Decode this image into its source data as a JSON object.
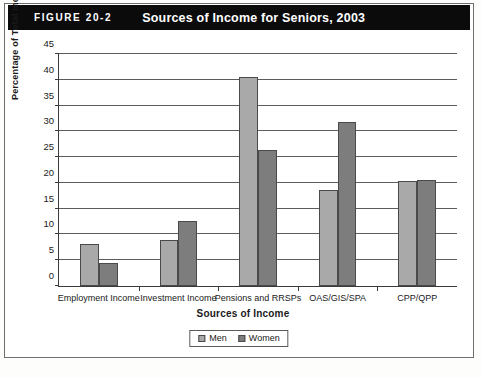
{
  "header": {
    "figure_number": "FIGURE 20-2",
    "title": "Sources of Income for Seniors, 2003"
  },
  "legend": {
    "position": "bottom-center",
    "entries": [
      {
        "label": "Men",
        "color": "#a9a9a9"
      },
      {
        "label": "Women",
        "color": "#7d7d7d"
      }
    ]
  },
  "colors": {
    "men": "#a9a9a9",
    "women": "#7d7d7d",
    "band": "#0b0b0b",
    "axis": "#3a3a3a",
    "gridline": "#5c5c5c"
  },
  "chart_data": {
    "type": "bar",
    "title": "Sources of Income for Seniors, 2003",
    "xlabel": "Sources of Income",
    "ylabel": "Percentage of Total Income",
    "categories": [
      "Employment Income",
      "Investment Income",
      "Pensions and RRSPs",
      "OAS/GIS/SPA",
      "CPP/QPP"
    ],
    "series": [
      {
        "name": "Men",
        "values": [
          8.2,
          9.0,
          40.5,
          18.6,
          20.4
        ]
      },
      {
        "name": "Women",
        "values": [
          4.4,
          12.7,
          26.3,
          31.8,
          20.6
        ]
      }
    ],
    "ylim": [
      0,
      45
    ],
    "ytick_step": 5,
    "yticks": [
      0,
      5,
      10,
      15,
      20,
      25,
      30,
      35,
      40,
      45
    ],
    "ytick_labels": [
      "0",
      "5",
      "10",
      "15",
      "20",
      "25",
      "30",
      "35",
      "40",
      "45"
    ],
    "grid": true,
    "legend": [
      "Men",
      "Women"
    ]
  }
}
